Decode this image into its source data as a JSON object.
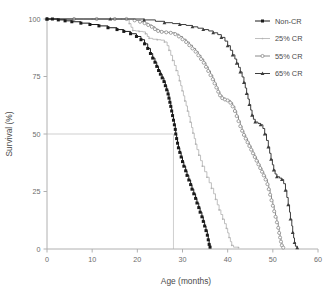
{
  "chart_data": {
    "type": "line",
    "title": "",
    "xlabel": "Age (months)",
    "ylabel": "Survival (%)",
    "xlim": [
      0,
      60
    ],
    "ylim": [
      0,
      100
    ],
    "xticks": [
      0,
      10,
      20,
      30,
      40,
      50,
      60
    ],
    "yticks": [
      0,
      25,
      50,
      75,
      100
    ],
    "xtick_labels": [
      "0",
      "10",
      "20",
      "30",
      "40",
      "50",
      "60"
    ],
    "ytick_labels": [
      "0",
      "25",
      "50",
      "75",
      "100"
    ],
    "grid": false,
    "legend_position": "top-right",
    "annotations": [
      {
        "name": "median-survival-guide",
        "description": "horizontal reference line at 50% survival meeting vertical drop line at 28 months",
        "y": 50,
        "x": 28
      }
    ],
    "series": [
      {
        "name": "Non-CR",
        "color": "#1a1a1a",
        "marker": "square-filled",
        "points": [
          [
            0,
            100
          ],
          [
            1.2,
            100
          ],
          [
            2.5,
            99.6
          ],
          [
            4.0,
            99.2
          ],
          [
            5.5,
            98.8
          ],
          [
            7.5,
            98.2
          ],
          [
            9.5,
            97.6
          ],
          [
            11.5,
            97.0
          ],
          [
            13.5,
            96.2
          ],
          [
            15.5,
            95.4
          ],
          [
            17.0,
            94.6
          ],
          [
            18.5,
            93.6
          ],
          [
            19.8,
            92.4
          ],
          [
            20.8,
            91.0
          ],
          [
            21.6,
            89.2
          ],
          [
            22.3,
            87.2
          ],
          [
            22.9,
            85.0
          ],
          [
            23.4,
            83.0
          ],
          [
            23.9,
            81.2
          ],
          [
            24.3,
            79.4
          ],
          [
            24.7,
            77.6
          ],
          [
            25.1,
            76.0
          ],
          [
            25.5,
            74.4
          ],
          [
            25.9,
            72.8
          ],
          [
            26.2,
            71.0
          ],
          [
            26.5,
            69.2
          ],
          [
            26.8,
            67.4
          ],
          [
            27.0,
            65.6
          ],
          [
            27.2,
            63.8
          ],
          [
            27.4,
            62.0
          ],
          [
            27.6,
            60.0
          ],
          [
            27.8,
            58.0
          ],
          [
            28.0,
            56.0
          ],
          [
            28.2,
            54.0
          ],
          [
            28.4,
            52.0
          ],
          [
            28.5,
            50.0
          ],
          [
            28.7,
            48.0
          ],
          [
            28.9,
            46.0
          ],
          [
            29.1,
            44.0
          ],
          [
            29.4,
            42.0
          ],
          [
            29.7,
            40.0
          ],
          [
            30.0,
            38.0
          ],
          [
            30.3,
            36.0
          ],
          [
            30.7,
            34.0
          ],
          [
            31.0,
            32.0
          ],
          [
            31.4,
            30.0
          ],
          [
            31.8,
            28.0
          ],
          [
            32.1,
            26.0
          ],
          [
            32.5,
            24.0
          ],
          [
            32.9,
            22.0
          ],
          [
            33.2,
            20.0
          ],
          [
            33.6,
            18.0
          ],
          [
            33.9,
            16.0
          ],
          [
            34.3,
            14.0
          ],
          [
            34.6,
            12.0
          ],
          [
            34.9,
            10.0
          ],
          [
            35.2,
            8.0
          ],
          [
            35.5,
            6.0
          ],
          [
            35.7,
            4.0
          ],
          [
            35.9,
            2.0
          ],
          [
            36.1,
            0.8
          ]
        ]
      },
      {
        "name": "25% CR",
        "color": "#b3b3b3",
        "marker": "small-dot",
        "points": [
          [
            0,
            100
          ],
          [
            5,
            100
          ],
          [
            10,
            100
          ],
          [
            14,
            100
          ],
          [
            16.5,
            100
          ],
          [
            17.6,
            99.6
          ],
          [
            18.2,
            98.0
          ],
          [
            18.6,
            96.4
          ],
          [
            19.0,
            95.0
          ],
          [
            19.6,
            94.8
          ],
          [
            20.4,
            94.6
          ],
          [
            21.2,
            94.4
          ],
          [
            21.8,
            93.6
          ],
          [
            22.2,
            92.4
          ],
          [
            22.6,
            91.6
          ],
          [
            23.4,
            91.2
          ],
          [
            24.4,
            91.0
          ],
          [
            25.2,
            90.8
          ],
          [
            26.0,
            90.0
          ],
          [
            26.6,
            88.4
          ],
          [
            27.0,
            86.4
          ],
          [
            27.4,
            84.2
          ],
          [
            27.8,
            82.0
          ],
          [
            28.2,
            79.8
          ],
          [
            28.6,
            77.6
          ],
          [
            29.0,
            75.4
          ],
          [
            29.3,
            73.2
          ],
          [
            29.6,
            71.0
          ],
          [
            29.9,
            68.8
          ],
          [
            30.2,
            66.6
          ],
          [
            30.5,
            64.4
          ],
          [
            30.8,
            62.2
          ],
          [
            31.1,
            60.0
          ],
          [
            31.4,
            57.6
          ],
          [
            31.7,
            55.2
          ],
          [
            32.0,
            52.8
          ],
          [
            32.3,
            50.4
          ],
          [
            32.6,
            48.0
          ],
          [
            32.9,
            45.6
          ],
          [
            33.2,
            43.2
          ],
          [
            33.6,
            40.8
          ],
          [
            34.0,
            38.4
          ],
          [
            34.4,
            36.0
          ],
          [
            34.9,
            33.6
          ],
          [
            35.4,
            31.2
          ],
          [
            35.9,
            28.8
          ],
          [
            36.4,
            26.4
          ],
          [
            36.9,
            24.0
          ],
          [
            37.3,
            21.6
          ],
          [
            37.7,
            19.2
          ],
          [
            38.1,
            17.0
          ],
          [
            38.5,
            15.0
          ],
          [
            38.9,
            13.0
          ],
          [
            39.3,
            11.0
          ],
          [
            39.7,
            9.0
          ],
          [
            40.0,
            7.0
          ],
          [
            40.3,
            5.0
          ],
          [
            40.6,
            3.2
          ],
          [
            40.9,
            1.6
          ],
          [
            41.3,
            0.8
          ],
          [
            42.4,
            0.6
          ]
        ]
      },
      {
        "name": "55% CR",
        "color": "#8a8a8a",
        "marker": "circle-open",
        "points": [
          [
            0,
            100
          ],
          [
            6,
            100
          ],
          [
            11,
            100
          ],
          [
            15,
            100
          ],
          [
            17.6,
            100
          ],
          [
            19.4,
            99.4
          ],
          [
            20.6,
            98.8
          ],
          [
            21.6,
            98.2
          ],
          [
            22.4,
            97.4
          ],
          [
            23.2,
            96.6
          ],
          [
            23.9,
            95.6
          ],
          [
            24.6,
            94.8
          ],
          [
            25.4,
            94.4
          ],
          [
            26.4,
            94.2
          ],
          [
            27.4,
            94.0
          ],
          [
            28.4,
            93.4
          ],
          [
            29.2,
            92.4
          ],
          [
            30.0,
            91.2
          ],
          [
            30.8,
            90.0
          ],
          [
            31.5,
            88.6
          ],
          [
            32.2,
            87.2
          ],
          [
            32.9,
            85.8
          ],
          [
            33.5,
            84.2
          ],
          [
            34.1,
            82.6
          ],
          [
            34.7,
            81.0
          ],
          [
            35.2,
            79.2
          ],
          [
            35.7,
            77.4
          ],
          [
            36.2,
            75.6
          ],
          [
            36.7,
            73.8
          ],
          [
            37.1,
            72.0
          ],
          [
            37.5,
            70.2
          ],
          [
            37.9,
            68.4
          ],
          [
            38.3,
            66.8
          ],
          [
            38.8,
            65.6
          ],
          [
            39.4,
            65.0
          ],
          [
            40.0,
            64.6
          ],
          [
            40.6,
            63.6
          ],
          [
            41.1,
            62.0
          ],
          [
            41.6,
            60.0
          ],
          [
            42.0,
            57.8
          ],
          [
            42.4,
            55.6
          ],
          [
            42.8,
            53.4
          ],
          [
            43.2,
            51.4
          ],
          [
            43.6,
            49.6
          ],
          [
            44.0,
            48.0
          ],
          [
            44.4,
            46.4
          ],
          [
            44.8,
            44.8
          ],
          [
            45.2,
            43.2
          ],
          [
            45.6,
            41.6
          ],
          [
            46.0,
            40.0
          ],
          [
            46.4,
            38.4
          ],
          [
            46.8,
            36.8
          ],
          [
            47.2,
            35.2
          ],
          [
            47.6,
            33.6
          ],
          [
            48.0,
            32.0
          ],
          [
            48.4,
            30.2
          ],
          [
            48.8,
            28.2
          ],
          [
            49.1,
            26.0
          ],
          [
            49.4,
            23.6
          ],
          [
            49.7,
            21.2
          ],
          [
            50.0,
            18.8
          ],
          [
            50.3,
            16.4
          ],
          [
            50.6,
            14.0
          ],
          [
            50.9,
            11.6
          ],
          [
            51.2,
            9.2
          ],
          [
            51.4,
            7.0
          ],
          [
            51.6,
            5.0
          ],
          [
            51.8,
            3.2
          ],
          [
            52.0,
            1.6
          ],
          [
            52.3,
            0.6
          ]
        ]
      },
      {
        "name": "65% CR",
        "color": "#3d3d3d",
        "marker": "triangle-filled",
        "points": [
          [
            0,
            100
          ],
          [
            8,
            100
          ],
          [
            14,
            100
          ],
          [
            18,
            100
          ],
          [
            21.5,
            99.6
          ],
          [
            24.0,
            99.0
          ],
          [
            26.0,
            98.4
          ],
          [
            27.8,
            98.0
          ],
          [
            29.4,
            97.6
          ],
          [
            30.8,
            97.2
          ],
          [
            32.2,
            96.6
          ],
          [
            33.4,
            96.0
          ],
          [
            34.6,
            95.4
          ],
          [
            35.8,
            94.8
          ],
          [
            36.8,
            94.0
          ],
          [
            37.8,
            93.2
          ],
          [
            38.6,
            92.0
          ],
          [
            39.4,
            90.4
          ],
          [
            40.0,
            88.4
          ],
          [
            40.6,
            86.4
          ],
          [
            41.1,
            84.4
          ],
          [
            41.6,
            82.6
          ],
          [
            42.0,
            80.8
          ],
          [
            42.4,
            79.0
          ],
          [
            42.8,
            77.0
          ],
          [
            43.2,
            74.8
          ],
          [
            43.6,
            72.4
          ],
          [
            43.9,
            70.0
          ],
          [
            44.2,
            67.6
          ],
          [
            44.5,
            65.2
          ],
          [
            44.8,
            62.8
          ],
          [
            45.1,
            60.4
          ],
          [
            45.4,
            58.2
          ],
          [
            45.7,
            56.4
          ],
          [
            46.1,
            55.2
          ],
          [
            46.7,
            54.6
          ],
          [
            47.3,
            54.0
          ],
          [
            47.8,
            52.4
          ],
          [
            48.2,
            50.0
          ],
          [
            48.6,
            47.2
          ],
          [
            49.0,
            44.4
          ],
          [
            49.3,
            41.6
          ],
          [
            49.6,
            39.0
          ],
          [
            49.9,
            36.6
          ],
          [
            50.2,
            34.4
          ],
          [
            50.5,
            32.6
          ],
          [
            50.9,
            31.4
          ],
          [
            51.5,
            30.8
          ],
          [
            52.0,
            30.2
          ],
          [
            52.4,
            28.4
          ],
          [
            52.8,
            25.6
          ],
          [
            53.1,
            22.4
          ],
          [
            53.4,
            19.2
          ],
          [
            53.7,
            16.0
          ],
          [
            53.9,
            13.0
          ],
          [
            54.2,
            10.0
          ],
          [
            54.4,
            7.2
          ],
          [
            54.6,
            4.8
          ],
          [
            54.8,
            2.8
          ],
          [
            55.0,
            1.2
          ],
          [
            55.4,
            0.6
          ]
        ]
      }
    ]
  },
  "legend": {
    "entries": [
      {
        "label": "Non-CR",
        "marker": "square-filled",
        "color": "#1a1a1a"
      },
      {
        "label": "25% CR",
        "marker": "small-dot",
        "color": "#b3b3b3"
      },
      {
        "label": "55% CR",
        "marker": "circle-open",
        "color": "#8a8a8a"
      },
      {
        "label": "65% CR",
        "marker": "triangle-filled",
        "color": "#3d3d3d"
      }
    ]
  },
  "axes": {
    "x_title": "Age (months)",
    "y_title": "Survival (%)",
    "x_tick_0": "0",
    "x_tick_1": "10",
    "x_tick_2": "20",
    "x_tick_3": "30",
    "x_tick_4": "40",
    "x_tick_5": "50",
    "x_tick_6": "60",
    "y_tick_0": "0",
    "y_tick_1": "25",
    "y_tick_2": "50",
    "y_tick_3": "75",
    "y_tick_4": "100"
  },
  "colors": {
    "axis": "#b0b0b0",
    "tick_text": "#6b6b6b",
    "title_text": "#4a4a4a",
    "guide_line": "#c9c9c9",
    "background": "#ffffff"
  }
}
